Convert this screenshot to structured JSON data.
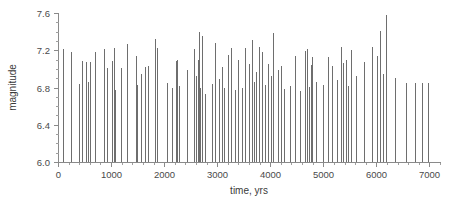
{
  "chart_data": {
    "type": "bar",
    "title": "",
    "subtitle": "",
    "xlabel": "time, yrs",
    "ylabel": "magnitude",
    "xlim": [
      0,
      7200
    ],
    "ylim": [
      6.0,
      7.6
    ],
    "xticks": [
      0,
      1000,
      2000,
      3000,
      4000,
      5000,
      6000,
      7000
    ],
    "xtick_labels": [
      "0",
      "1000",
      "2000",
      "3000",
      "4000",
      "5000",
      "6000",
      "7000"
    ],
    "yticks": [
      6.0,
      6.4,
      6.8,
      7.2,
      7.6
    ],
    "ytick_labels": [
      "6.0",
      "6.4",
      "6.8",
      "7.2",
      "7.6"
    ],
    "x_minor_tick_step": 200,
    "y_minor_tick_step": 0.1,
    "grid": false,
    "legend": null,
    "baseline": 6.0,
    "series_name": "earthquake magnitude",
    "marker_color": "#555555",
    "axis_color": "#8a8a8a",
    "x": [
      90,
      250,
      395,
      455,
      520,
      560,
      610,
      700,
      860,
      920,
      1010,
      1050,
      1075,
      1180,
      1300,
      1465,
      1490,
      1560,
      1640,
      1690,
      1830,
      1870,
      2060,
      2140,
      2215,
      2250,
      2290,
      2440,
      2560,
      2610,
      2630,
      2660,
      2680,
      2720,
      2780,
      2900,
      2960,
      3030,
      3090,
      3130,
      3200,
      3270,
      3330,
      3400,
      3470,
      3530,
      3600,
      3660,
      3700,
      3740,
      3790,
      3850,
      3900,
      3960,
      4010,
      4060,
      4140,
      4200,
      4260,
      4380,
      4470,
      4560,
      4660,
      4700,
      4740,
      4760,
      4790,
      4870,
      4990,
      5080,
      5170,
      5250,
      5340,
      5380,
      5420,
      5470,
      5520,
      5620,
      5760,
      5910,
      6010,
      6060,
      6120,
      6180,
      6350,
      6560,
      6720,
      6860,
      6980
    ],
    "values": [
      7.21,
      7.18,
      6.84,
      7.08,
      7.07,
      6.86,
      7.07,
      7.18,
      7.21,
      7.01,
      7.08,
      7.22,
      6.77,
      7.01,
      7.27,
      7.14,
      6.83,
      6.95,
      7.02,
      7.03,
      7.32,
      7.22,
      6.85,
      6.79,
      7.08,
      7.09,
      6.82,
      6.99,
      7.21,
      6.92,
      7.1,
      7.4,
      6.8,
      7.35,
      6.73,
      6.84,
      7.28,
      6.89,
      7.02,
      6.8,
      7.15,
      7.22,
      6.77,
      7.09,
      6.79,
      7.22,
      7.05,
      7.31,
      6.86,
      6.97,
      7.24,
      7.18,
      6.83,
      7.05,
      6.92,
      7.38,
      6.99,
      7.03,
      6.78,
      6.82,
      7.14,
      6.76,
      7.19,
      7.21,
      6.81,
      7.04,
      7.13,
      6.86,
      6.83,
      7.13,
      7.03,
      6.88,
      7.24,
      7.06,
      7.09,
      6.82,
      7.2,
      6.92,
      7.07,
      7.23,
      7.14,
      7.41,
      6.94,
      7.58,
      6.9,
      6.85,
      6.85,
      6.85,
      6.85
    ]
  },
  "figure": {
    "background_color": "#ffffff",
    "plot_area": {
      "left": 58,
      "right": 440,
      "top": 13,
      "bottom": 162
    }
  }
}
